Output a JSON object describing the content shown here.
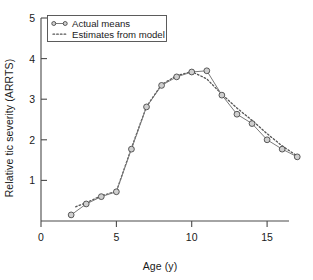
{
  "chart_data": {
    "type": "line",
    "title": "",
    "xlabel": "Age (y)",
    "ylabel": "Relative tic severity (ARRTS)",
    "xlim": [
      0,
      17.8
    ],
    "ylim": [
      0,
      5
    ],
    "xticks": [
      0,
      5,
      10,
      15
    ],
    "yticks": [
      1,
      2,
      3,
      4,
      5
    ],
    "xticklabels": [
      "0",
      "5",
      "10",
      "15"
    ],
    "yticklabels": [
      "1",
      "2",
      "3",
      "4",
      "5"
    ],
    "grid": false,
    "legend_position": "upper-left",
    "series": [
      {
        "name": "Actual means",
        "style": "solid-with-circle-markers",
        "x": [
          2,
          3,
          4,
          5,
          6,
          7,
          8,
          9,
          10,
          11,
          12,
          13,
          14,
          15,
          16,
          17
        ],
        "values": [
          0.15,
          0.42,
          0.6,
          0.72,
          1.77,
          2.81,
          3.34,
          3.55,
          3.67,
          3.7,
          3.1,
          2.63,
          2.4,
          2.0,
          1.77,
          1.58
        ]
      },
      {
        "name": "Estimates from model",
        "style": "dotted",
        "x": [
          2.3,
          3,
          4,
          5,
          6,
          7,
          8,
          9,
          10,
          11,
          12,
          13,
          14,
          15,
          16,
          17
        ],
        "values": [
          0.35,
          0.45,
          0.62,
          0.73,
          1.8,
          2.82,
          3.36,
          3.58,
          3.68,
          3.5,
          3.12,
          2.78,
          2.48,
          2.15,
          1.85,
          1.6
        ]
      }
    ]
  },
  "legend": {
    "entries": [
      {
        "label": "Actual means",
        "marker": "circle-line-marker"
      },
      {
        "label": "Estimates from model",
        "marker": "dotted-line-marker"
      }
    ]
  },
  "colors": {
    "axis": "#4a4a4a",
    "actual_line": "#7a7a7a",
    "model_line": "#555555",
    "marker_fill": "#cfcfcf",
    "background": "#ffffff",
    "text": "#1a1a1a"
  }
}
